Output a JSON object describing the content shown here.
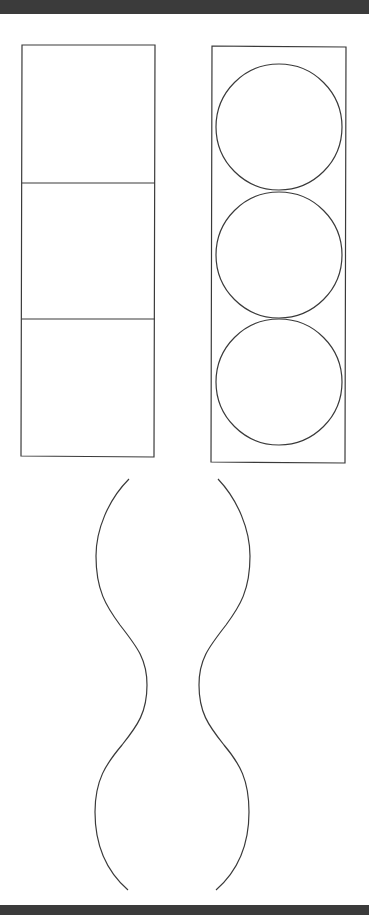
{
  "header_bar": {
    "color": "#3b3b3b"
  },
  "footer_bar": {
    "color": "#3b3b3b"
  },
  "figures": {
    "stacked_squares": {
      "description": "Tall rectangle divided into three equal square cells",
      "cells": 3,
      "bounds": {
        "x": 22,
        "y": 45,
        "width": 133,
        "height": 411
      },
      "dividers_y": [
        183,
        319
      ]
    },
    "stacked_circles": {
      "description": "Tall rectangle containing three tangent circles stacked vertically",
      "count": 3,
      "bounds": {
        "x": 212,
        "y": 46,
        "width": 134,
        "height": 416
      },
      "circles": [
        {
          "cx": 279,
          "cy": 127,
          "r": 63
        },
        {
          "cx": 279,
          "cy": 255,
          "r": 63
        },
        {
          "cx": 279,
          "cy": 383,
          "r": 63
        }
      ]
    },
    "wavy_outline": {
      "description": "Pair of mirrored wavy curves forming a peanut / hourglass silhouette with two bulges and a narrow waist",
      "left_curve": {
        "start": [
          129,
          479
        ],
        "bulge_x": 96,
        "waist_x": 147,
        "end": [
          128,
          890
        ]
      },
      "right_curve": {
        "start": [
          218,
          479
        ],
        "bulge_x": 250,
        "waist_x": 199,
        "end": [
          216,
          890
        ]
      },
      "waist_y": 685
    }
  },
  "stroke_color": "#3a3a3a"
}
